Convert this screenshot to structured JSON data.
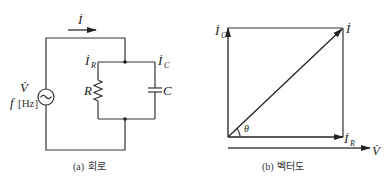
{
  "circuit": {
    "current_label": "İ",
    "source_voltage_label": "V̇",
    "source_freq_label": "f",
    "source_freq_unit": "[Hz]",
    "resistor_label": "R",
    "capacitor_label": "C",
    "branch_current_r": {
      "main": "İ",
      "sub": "R"
    },
    "branch_current_c": {
      "main": "İ",
      "sub": "C"
    },
    "caption_prefix": "(a)",
    "caption_text": "회로"
  },
  "vector_diagram": {
    "ic_label": {
      "main": "İ",
      "sub": "C"
    },
    "i_label": "İ",
    "ir_label": {
      "main": "İ",
      "sub": "R"
    },
    "v_label": "V̇",
    "angle_label": "θ",
    "caption_prefix": "(b)",
    "caption_text": "벡터도"
  },
  "colors": {
    "line": "#333333",
    "text": "#222222",
    "background": "#ffffff"
  }
}
